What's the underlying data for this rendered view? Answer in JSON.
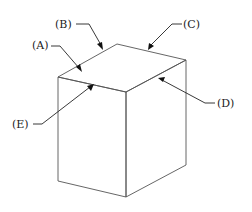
{
  "diagram": {
    "type": "isometric-cube-edge-labels",
    "labels": {
      "A": "(A)",
      "B": "(B)",
      "C": "(C)",
      "D": "(D)",
      "E": "(E)"
    },
    "colors": {
      "edge": "#555555",
      "leader": "#222222",
      "background": "#ffffff"
    }
  }
}
